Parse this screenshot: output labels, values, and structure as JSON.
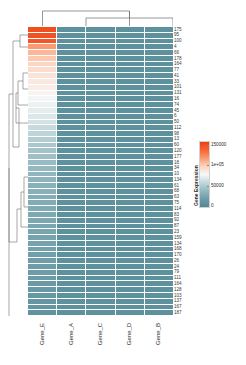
{
  "plot": {
    "type": "clustered-heatmap",
    "legend_title": "Gene Expression"
  },
  "chart_data": {
    "type": "heatmap",
    "title": "",
    "xlabel": "",
    "ylabel": "",
    "legend_title": "Gene Expression",
    "legend_position": "right",
    "grid": false,
    "colorbar": {
      "ticks": [
        "150000",
        "1e+05",
        "50000",
        "0"
      ],
      "tick_values": [
        150000,
        100000,
        50000,
        0
      ],
      "vmin": 0,
      "vmax": 160000,
      "colors": [
        "#f4511e",
        "#fb6a35",
        "#fdd7c6",
        "#f7f7f7",
        "#cfe0e4",
        "#8fb6bf",
        "#5b8f9c",
        "#4f8795"
      ]
    },
    "columns": [
      "Gene_E",
      "Gene_A",
      "Gene_C",
      "Gene_D",
      "Gene_B"
    ],
    "rows": [
      "175",
      "95",
      "100",
      "4",
      "66",
      "178",
      "164",
      "77",
      "41",
      "33",
      "101",
      "131",
      "16",
      "74",
      "45",
      "6",
      "50",
      "112",
      "98",
      "13",
      "60",
      "120",
      "177",
      "18",
      "34",
      "10",
      "134",
      "61",
      "68",
      "63",
      "75",
      "114",
      "83",
      "92",
      "87",
      "23",
      "159",
      "134",
      "168",
      "170",
      "26",
      "24",
      "79",
      "111",
      "164",
      "128",
      "103",
      "137",
      "167",
      "187"
    ],
    "values": [
      [
        152000,
        9000,
        9000,
        9000,
        9000
      ],
      [
        150000,
        9000,
        9000,
        9000,
        9000
      ],
      [
        148000,
        9000,
        9000,
        9000,
        9000
      ],
      [
        120000,
        9000,
        9000,
        9000,
        9000
      ],
      [
        110000,
        9000,
        9000,
        9000,
        9000
      ],
      [
        104000,
        9000,
        9000,
        9000,
        9000
      ],
      [
        99000,
        9000,
        9000,
        9000,
        9000
      ],
      [
        95000,
        9000,
        9000,
        9000,
        9000
      ],
      [
        91000,
        9000,
        9000,
        9000,
        9000
      ],
      [
        88000,
        9000,
        9000,
        9000,
        9000
      ],
      [
        85000,
        9000,
        9000,
        9000,
        9000
      ],
      [
        82000,
        9000,
        9000,
        9000,
        9000
      ],
      [
        79000,
        9000,
        9000,
        9000,
        9000
      ],
      [
        76000,
        9000,
        9000,
        9000,
        9000
      ],
      [
        73000,
        9000,
        9000,
        9000,
        9000
      ],
      [
        70000,
        9000,
        9000,
        9000,
        9000
      ],
      [
        67000,
        9000,
        9000,
        9000,
        9000
      ],
      [
        62000,
        9000,
        9000,
        9000,
        9000
      ],
      [
        58000,
        9000,
        9000,
        9000,
        9000
      ],
      [
        54000,
        9000,
        9000,
        9000,
        9000
      ],
      [
        50000,
        9000,
        9000,
        9000,
        9000
      ],
      [
        47000,
        9000,
        9000,
        9000,
        9000
      ],
      [
        45000,
        9000,
        9000,
        9000,
        9000
      ],
      [
        43000,
        9000,
        9000,
        9000,
        9000
      ],
      [
        41000,
        9000,
        9000,
        9000,
        9000
      ],
      [
        39000,
        9000,
        9000,
        9000,
        9000
      ],
      [
        37000,
        9000,
        9000,
        9000,
        9000
      ],
      [
        35000,
        9000,
        9000,
        9000,
        9000
      ],
      [
        34000,
        9000,
        9000,
        9000,
        9000
      ],
      [
        32000,
        9000,
        9000,
        9000,
        9000
      ],
      [
        31000,
        9000,
        9000,
        9000,
        9000
      ],
      [
        30000,
        9000,
        9000,
        9000,
        9000
      ],
      [
        29000,
        9000,
        9000,
        9000,
        9000
      ],
      [
        28000,
        9000,
        9000,
        9000,
        9000
      ],
      [
        27000,
        9000,
        9000,
        9000,
        9000
      ],
      [
        26000,
        9000,
        9000,
        9000,
        9000
      ],
      [
        25000,
        9000,
        9000,
        9000,
        9000
      ],
      [
        24000,
        9000,
        9000,
        9000,
        9000
      ],
      [
        23000,
        9000,
        9000,
        9000,
        9000
      ],
      [
        22000,
        9000,
        9000,
        9000,
        9000
      ],
      [
        21000,
        9000,
        9000,
        9000,
        9000
      ],
      [
        20000,
        9000,
        9000,
        9000,
        9000
      ],
      [
        19000,
        9000,
        9000,
        9000,
        9000
      ],
      [
        18000,
        9000,
        9000,
        9000,
        9000
      ],
      [
        17000,
        9000,
        9000,
        9000,
        9000
      ],
      [
        16000,
        9000,
        9000,
        9000,
        9000
      ],
      [
        15000,
        9000,
        9000,
        9000,
        9000
      ],
      [
        14000,
        9000,
        9000,
        9000,
        9000
      ],
      [
        13000,
        9000,
        9000,
        9000,
        9000
      ],
      [
        12000,
        9000,
        9000,
        9000,
        9000
      ]
    ]
  }
}
